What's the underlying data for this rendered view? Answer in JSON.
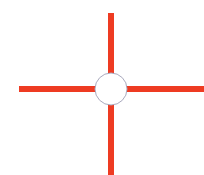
{
  "figure": {
    "background_color": "#ffffff",
    "width": 204,
    "height": 175,
    "alt_text": "Red crosshair with a small white circle at the intersection"
  },
  "crosshair": {
    "line_color": "#ee3b22",
    "line_width": 6,
    "center_x": 111,
    "center_y": 89,
    "arms": [
      {
        "name": "arm-up",
        "direction": "up",
        "x1": 111,
        "y1": 13,
        "x2": 111,
        "y2": 89,
        "length": 76
      },
      {
        "name": "arm-down",
        "direction": "down",
        "x1": 111,
        "y1": 89,
        "x2": 111,
        "y2": 175,
        "length": 86
      },
      {
        "name": "arm-left",
        "direction": "left",
        "x1": 19,
        "y1": 89,
        "x2": 111,
        "y2": 89,
        "length": 92
      },
      {
        "name": "arm-right",
        "direction": "right",
        "x1": 111,
        "y1": 89,
        "x2": 204,
        "y2": 89,
        "length": 93
      }
    ]
  },
  "center_circle": {
    "name": "center-circle",
    "center_x": 111,
    "center_y": 89,
    "radius": 16,
    "fill_color": "#ffffff",
    "stroke_color": "#a9a9bd",
    "stroke_width": 1
  }
}
